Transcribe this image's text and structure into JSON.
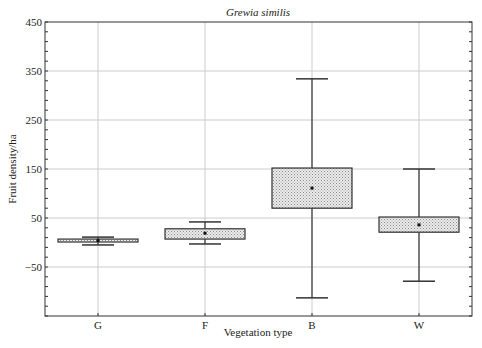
{
  "chart_data": {
    "type": "box",
    "title": "Grewia similis",
    "xlabel": "Vegetation type",
    "ylabel": "Fruit density/ha",
    "ylim": [
      -150,
      450
    ],
    "yticks": [
      450,
      350,
      250,
      150,
      50,
      -50
    ],
    "ytick_labels": [
      "450",
      "350",
      "250",
      "150",
      "50",
      "−50"
    ],
    "grid": true,
    "categories": [
      "G",
      "F",
      "B",
      "W"
    ],
    "series": [
      {
        "name": "G",
        "whisker_low": -5,
        "q1": 1,
        "median": 4,
        "q3": 7,
        "whisker_high": 11
      },
      {
        "name": "F",
        "whisker_low": -3,
        "q1": 7,
        "median": 19,
        "q3": 28,
        "whisker_high": 42
      },
      {
        "name": "B",
        "whisker_low": -113,
        "q1": 70,
        "median": 111,
        "q3": 152,
        "whisker_high": 334
      },
      {
        "name": "W",
        "whisker_low": -79,
        "q1": 21,
        "median": 36,
        "q3": 52,
        "whisker_high": 150
      }
    ],
    "box_fill": "#e6e6e6",
    "line_color": "#333333",
    "grid_color": "#cccccc"
  }
}
